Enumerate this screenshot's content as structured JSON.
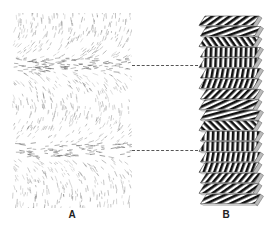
{
  "figure": {
    "panel_a": {
      "label": "A",
      "description": "Scattered dashed-line texture with curved arcs and two dense horizontal bands"
    },
    "panel_b": {
      "label": "B",
      "description": "Stack of striped plates with stripe orientation rotating from top to bottom"
    },
    "connectors": [
      {
        "y": 65,
        "style": "dashed"
      },
      {
        "y": 150,
        "style": "dashed"
      }
    ],
    "colors": {
      "ink": "#222222",
      "texture": "#8a8a8a",
      "background": "#ffffff"
    }
  }
}
